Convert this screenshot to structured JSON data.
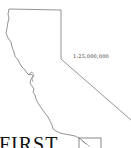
{
  "map": {
    "region": "California outline",
    "scale": "1:25,000,000",
    "inset_box": true,
    "colors": {
      "outline": "#555555",
      "background": "#ffffff",
      "text": "#333333"
    }
  },
  "heading": {
    "text": "FIRST"
  }
}
